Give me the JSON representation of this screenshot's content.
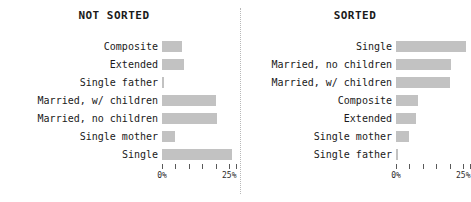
{
  "chart_data": {
    "type": "bar",
    "title": "",
    "orientation": "horizontal",
    "xlabel": "",
    "ylabel": "",
    "xlim": [
      0,
      27.5
    ],
    "grid": false,
    "legend": null,
    "panels": [
      {
        "title": "NOT SORTED",
        "categories": [
          "Composite",
          "Extended",
          "Single father",
          "Married, w/ children",
          "Married, no children",
          "Single mother",
          "Single"
        ],
        "values": [
          7.5,
          8.0,
          0.8,
          20.0,
          20.5,
          5.0,
          26.0
        ],
        "axis": {
          "ticks": [
            0,
            5,
            10,
            15,
            20,
            25,
            27.5
          ],
          "tick_labels": [
            "0%",
            "",
            "",
            "",
            "",
            "25%",
            ""
          ],
          "labeled_ticks": [
            {
              "value": 0,
              "label": "0%"
            },
            {
              "value": 25,
              "label": "25%"
            }
          ]
        }
      },
      {
        "title": "SORTED",
        "categories": [
          "Single",
          "Married, no children",
          "Married, w/ children",
          "Composite",
          "Extended",
          "Single mother",
          "Single father"
        ],
        "values": [
          26.0,
          20.5,
          20.0,
          8.0,
          7.5,
          5.0,
          0.8
        ],
        "axis": {
          "ticks": [
            0,
            5,
            10,
            15,
            20,
            25,
            27.5
          ],
          "tick_labels": [
            "0%",
            "",
            "",
            "",
            "",
            "25%",
            ""
          ],
          "labeled_ticks": [
            {
              "value": 0,
              "label": "0%"
            },
            {
              "value": 25,
              "label": "25%"
            }
          ]
        }
      }
    ]
  },
  "colors": {
    "bar": "#c2c2c2",
    "text": "#1a1a1a",
    "tick": "#5a5a5a",
    "divider": "#b8b8b8",
    "background": "#ffffff"
  },
  "panel_left": {
    "title": "NOT SORTED"
  },
  "panel_right": {
    "title": "SORTED"
  }
}
